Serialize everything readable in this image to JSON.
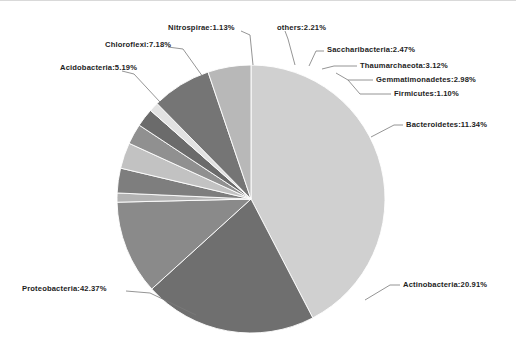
{
  "figure": {
    "background_color": "#ffffff",
    "border_color": "#d9d9d9",
    "label_text_color": "#1d1d1d",
    "leader_line_color": "#7a7a7a"
  },
  "chart_data": {
    "type": "pie",
    "title": "",
    "subtitle": "",
    "xlabel": "",
    "ylabel": "",
    "grid": false,
    "legend_position": "none",
    "label_format": "{name}:{value}%",
    "center": {
      "x": 251,
      "y": 198
    },
    "radius": 134,
    "start_angle_deg": -90,
    "direction": "clockwise",
    "total_percent": 100.0,
    "categories": [
      "Proteobacteria",
      "Actinobacteria",
      "Bacteroidetes",
      "Firmicutes",
      "Gemmatimonadetes",
      "Thaumarchaeota",
      "Saccharibacteria",
      "others",
      "Nitrospirae",
      "Chloroflexi",
      "Acidobacteria"
    ],
    "values": [
      42.37,
      20.91,
      11.34,
      1.1,
      2.98,
      3.12,
      2.47,
      2.21,
      1.13,
      7.18,
      5.19
    ],
    "colors": [
      "#d0d0d0",
      "#6f6f6f",
      "#8a8a8a",
      "#b3b3b3",
      "#7e7e7e",
      "#c2c2c2",
      "#909090",
      "#6b6b6b",
      "#e2e2e2",
      "#757575",
      "#b8b8b8"
    ],
    "slices": [
      {
        "name": "Proteobacteria",
        "value": 42.37,
        "label": "Proteobacteria:42.37%",
        "color": "#d0d0d0",
        "label_x": 22,
        "label_y": 283,
        "leader": [
          [
            196,
            314
          ],
          [
            150,
            292
          ],
          [
            126,
            290
          ]
        ]
      },
      {
        "name": "Actinobacteria",
        "value": 20.91,
        "label": "Actinobacteria:20.91%",
        "color": "#6f6f6f",
        "label_x": 403,
        "label_y": 279,
        "leader": [
          [
            365,
            299
          ],
          [
            390,
            284
          ],
          [
            400,
            284
          ]
        ]
      },
      {
        "name": "Bacteroidetes",
        "value": 11.34,
        "label": "Bacteroidetes:11.34%",
        "color": "#8a8a8a",
        "label_x": 406,
        "label_y": 119,
        "leader": [
          [
            371,
            136
          ],
          [
            394,
            124
          ],
          [
            403,
            124
          ]
        ]
      },
      {
        "name": "Firmicutes",
        "value": 1.1,
        "label": "Firmicutes:1.10%",
        "color": "#b3b3b3",
        "label_x": 394,
        "label_y": 88,
        "leader": [
          [
            348,
            79
          ],
          [
            360,
            93
          ],
          [
            391,
            93
          ]
        ]
      },
      {
        "name": "Gemmatimonadetes",
        "value": 2.98,
        "label": "Gemmatimonadetes:2.98%",
        "color": "#7e7e7e",
        "label_x": 376,
        "label_y": 74,
        "leader": [
          [
            336,
            72
          ],
          [
            348,
            79
          ],
          [
            373,
            79
          ]
        ]
      },
      {
        "name": "Thaumarchaeota",
        "value": 3.12,
        "label": "Thaumarchaeota:3.12%",
        "color": "#c2c2c2",
        "label_x": 360,
        "label_y": 60,
        "leader": [
          [
            322,
            68
          ],
          [
            334,
            65
          ],
          [
            357,
            65
          ]
        ]
      },
      {
        "name": "Saccharibacteria",
        "value": 2.47,
        "label": "Saccharibacteria:2.47%",
        "color": "#909090",
        "label_x": 327,
        "label_y": 44,
        "leader": [
          [
            309,
            65
          ],
          [
            316,
            50
          ],
          [
            324,
            50
          ]
        ]
      },
      {
        "name": "others",
        "value": 2.21,
        "label": "others:2.21%",
        "color": "#6b6b6b",
        "label_x": 277,
        "label_y": 22,
        "leader": [
          [
            295,
            64
          ],
          [
            288,
            38
          ],
          [
            285,
            30
          ]
        ]
      },
      {
        "name": "Nitrospirae",
        "value": 1.13,
        "label": "Nitrospirae:1.13%",
        "color": "#e2e2e2",
        "label_x": 168,
        "label_y": 22,
        "leader": [
          [
            253,
            64
          ],
          [
            250,
            34
          ],
          [
            241,
            30
          ]
        ]
      },
      {
        "name": "Chloroflexi",
        "value": 7.18,
        "label": "Chloroflexi:7.18%",
        "color": "#757575",
        "label_x": 105,
        "label_y": 39,
        "leader": [
          [
            203,
            76
          ],
          [
            183,
            48
          ],
          [
            168,
            46
          ]
        ]
      },
      {
        "name": "Acidobacteria",
        "value": 5.19,
        "label": "Acidobacteria:5.19%",
        "color": "#b8b8b8",
        "label_x": 60,
        "label_y": 62,
        "leader": [
          [
            160,
            101
          ],
          [
            134,
            73
          ],
          [
            122,
            70
          ]
        ]
      }
    ]
  }
}
